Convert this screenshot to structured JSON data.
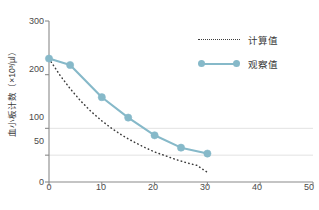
{
  "chart_data": {
    "type": "line",
    "title": "",
    "xlabel": "",
    "ylabel": "血小板计数（×10³/µl）",
    "xlim": [
      0,
      50
    ],
    "ylim": [
      0,
      300
    ],
    "grid": "horizontal gridlines at y=50 and y=100 only",
    "legend_position": "upper-right inside plot",
    "xticks": [
      0,
      10,
      20,
      30,
      40,
      50
    ],
    "xticklabels": [
      "0",
      "10",
      "20",
      "30",
      "40",
      "50"
    ],
    "yticks": [
      0,
      50,
      100,
      200,
      300
    ],
    "yticklabels": [
      "0",
      "50",
      "100",
      "200",
      "300"
    ],
    "gridline_values": [
      50,
      100
    ],
    "series": [
      {
        "name": "计算值",
        "style": "dotted",
        "color": "#3d3d3d",
        "markers": false,
        "x": [
          0,
          2,
          4,
          6,
          8,
          10,
          12,
          14,
          16,
          18,
          20,
          22,
          24,
          26,
          28,
          30
        ],
        "values": [
          230,
          200,
          174,
          151,
          131,
          114,
          99,
          86,
          75,
          65,
          56,
          49,
          42,
          36,
          31,
          18
        ]
      },
      {
        "name": "观察值",
        "style": "solid",
        "color": "#86b9c9",
        "markers": true,
        "x": [
          0,
          4,
          10,
          15,
          20,
          25,
          30
        ],
        "values": [
          230,
          218,
          158,
          120,
          87,
          64,
          53
        ]
      }
    ]
  },
  "legend": {
    "items": [
      {
        "label": "计算值",
        "key": "dotted-line-key"
      },
      {
        "label": "观察值",
        "key": "solid-line-marker-key"
      }
    ]
  },
  "axes": {
    "y_axis_label": "血小板计数（×10³/µl）",
    "y_tick_labels": [
      "300",
      "200",
      "100",
      "50",
      "0"
    ],
    "x_tick_labels": [
      "0",
      "10",
      "20",
      "30",
      "40",
      "50"
    ]
  },
  "colors": {
    "observed": "#86b9c9",
    "calculated": "#3d3d3d",
    "axis": "#8a8a8a",
    "grid": "#e2e2e2",
    "text": "#3a3a3a"
  }
}
